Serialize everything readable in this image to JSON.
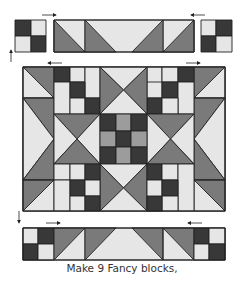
{
  "diagram": {
    "caption": "Make 9 Fancy blocks,",
    "colors": {
      "light": "#e6e6e6",
      "medium": "#7a7a7a",
      "dark": "#383838",
      "midgray": "#9c9c9c",
      "outline": "#222222"
    },
    "parts": [
      {
        "name": "top-left-four-patch"
      },
      {
        "name": "top-center-flying-geese-strip"
      },
      {
        "name": "top-right-four-patch"
      },
      {
        "name": "center-block"
      },
      {
        "name": "bottom-strip"
      }
    ],
    "arrows": [
      {
        "name": "press-arrow-top-left",
        "direction": "right"
      },
      {
        "name": "press-arrow-top-right",
        "direction": "left"
      },
      {
        "name": "press-arrow-row1-left",
        "direction": "left"
      },
      {
        "name": "press-arrow-row1-right",
        "direction": "right"
      },
      {
        "name": "press-arrow-bottom-left",
        "direction": "right"
      },
      {
        "name": "press-arrow-bottom-right",
        "direction": "left"
      },
      {
        "name": "join-arrow-up",
        "direction": "up"
      },
      {
        "name": "join-arrow-down",
        "direction": "down"
      }
    ]
  }
}
